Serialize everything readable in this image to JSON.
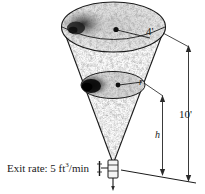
{
  "figure": {
    "title_alt": "Conical tank draining diagram",
    "labels": {
      "top_radius": "4'",
      "water_radius": "r",
      "tank_height": "10'",
      "water_height": "h",
      "exit_rate_prefix": "Exit rate: 5 ft",
      "exit_rate_exponent": "3",
      "exit_rate_suffix": "/min"
    },
    "colors": {
      "ink": "#1a1a1a",
      "background": "#ffffff",
      "texture_dark": "#2b2b2b",
      "texture_mid": "#8a8a8a",
      "texture_light": "#c9c9c9"
    },
    "parts": {
      "cone": "inverted-cone",
      "top_rim": "top-ellipse-rim",
      "water_surface": "inner-ellipse-water-surface",
      "valve": "outlet-valve-with-handwheel",
      "dim_height": "height-dimension-line",
      "dim_water": "water-depth-dimension-line",
      "radius_top": "top-radius-leader-line",
      "radius_water": "water-radius-leader-line"
    }
  }
}
